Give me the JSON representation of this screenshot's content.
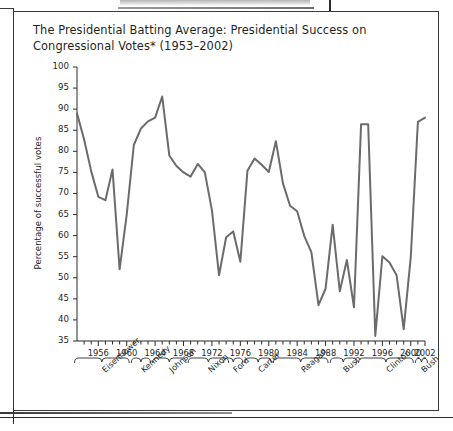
{
  "figure": {
    "title": "The Presidential Batting Average: Presidential Success on Congressional Votes* (1953–2002)"
  },
  "chart_data": {
    "type": "line",
    "title": "The Presidential Batting Average: Presidential Success on Congressional Votes* (1953–2002)",
    "xlabel": "",
    "ylabel": "Percentage of successful votes",
    "xlim": [
      1953,
      2002
    ],
    "ylim": [
      35,
      100
    ],
    "ytick_step": 5,
    "yticks": [
      100,
      95,
      90,
      85,
      80,
      75,
      70,
      65,
      60,
      55,
      50,
      45,
      40,
      35
    ],
    "xticks": [
      1956,
      1960,
      1964,
      1968,
      1972,
      1976,
      1980,
      1984,
      1988,
      1992,
      1996,
      2000,
      2002
    ],
    "xtick_every_year": true,
    "grid": false,
    "legend": "none",
    "line_color": "#6b6b6b",
    "line_width": 2.0,
    "x": [
      1953,
      1954,
      1955,
      1956,
      1957,
      1958,
      1959,
      1960,
      1961,
      1962,
      1963,
      1964,
      1965,
      1966,
      1967,
      1968,
      1969,
      1970,
      1971,
      1972,
      1973,
      1974,
      1975,
      1976,
      1977,
      1978,
      1979,
      1980,
      1981,
      1982,
      1983,
      1984,
      1985,
      1986,
      1987,
      1988,
      1989,
      1990,
      1991,
      1992,
      1993,
      1994,
      1995,
      1996,
      1997,
      1998,
      1999,
      2000,
      2001,
      2002
    ],
    "values": [
      89.0,
      82.8,
      75.3,
      69.2,
      68.4,
      75.7,
      52.0,
      65.0,
      81.5,
      85.4,
      87.1,
      88.0,
      93.0,
      79.0,
      76.5,
      75.0,
      74.0,
      77.0,
      75.0,
      66.0,
      50.6,
      59.6,
      61.0,
      53.8,
      75.4,
      78.3,
      76.8,
      75.1,
      82.4,
      72.4,
      67.1,
      65.8,
      59.9,
      56.1,
      43.5,
      47.4,
      62.6,
      46.8,
      54.2,
      43.0,
      86.4,
      86.4,
      36.2,
      55.1,
      53.6,
      50.6,
      37.8,
      55.0,
      87.0,
      88.0
    ],
    "presidents": [
      {
        "name": "Eisenhower",
        "start": 1953,
        "end": 1960
      },
      {
        "name": "Kennedy",
        "start": 1961,
        "end": 1963
      },
      {
        "name": "Johnson",
        "start": 1964,
        "end": 1968
      },
      {
        "name": "Nixon",
        "start": 1969,
        "end": 1974
      },
      {
        "name": "Ford",
        "start": 1974,
        "end": 1976
      },
      {
        "name": "Carter",
        "start": 1977,
        "end": 1980
      },
      {
        "name": "Reagan",
        "start": 1981,
        "end": 1988
      },
      {
        "name": "Bush",
        "start": 1989,
        "end": 1992
      },
      {
        "name": "Clinton",
        "start": 1993,
        "end": 2000
      },
      {
        "name": "Bush",
        "start": 2001,
        "end": 2002
      }
    ]
  }
}
